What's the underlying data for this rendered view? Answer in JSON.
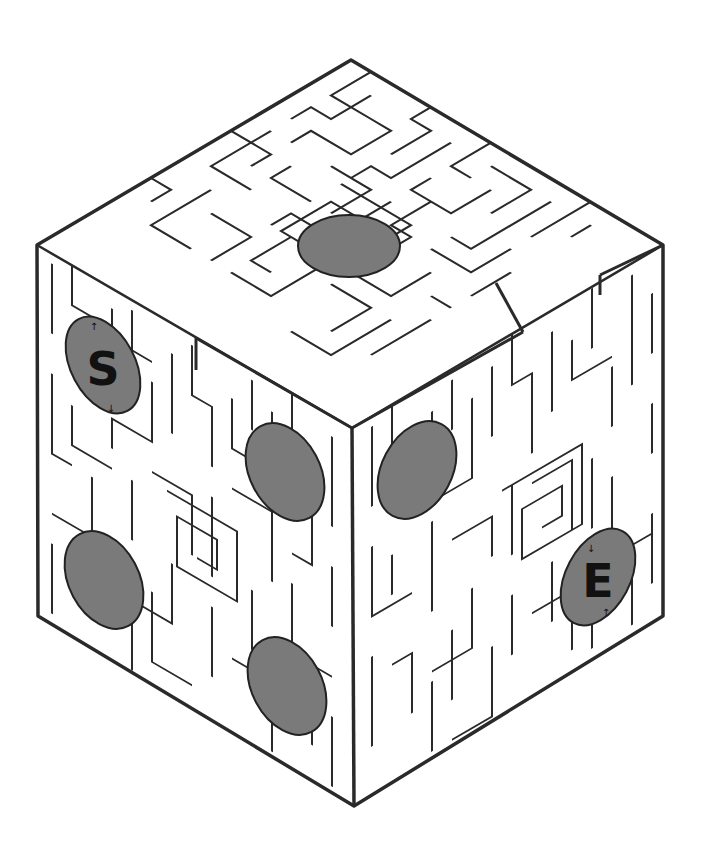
{
  "page": {
    "header_fragment": ""
  },
  "maze": {
    "type": "isometric-cube-dice-maze",
    "start_label": "S",
    "end_label": "E",
    "colors": {
      "wall": "#2a2a2a",
      "background": "#ffffff",
      "pip": "#7a7a7a",
      "pip_outline": "#222222",
      "marker_text": "#111111"
    },
    "faces": [
      {
        "name": "top",
        "pips": 1
      },
      {
        "name": "left",
        "pips": 4
      },
      {
        "name": "right",
        "pips": 2
      }
    ],
    "start_arrows": [
      "↑",
      "↓"
    ],
    "end_arrows": [
      "↓",
      "↑"
    ]
  }
}
